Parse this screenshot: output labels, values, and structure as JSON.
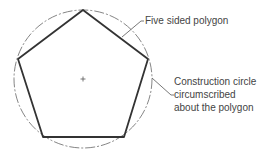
{
  "diagram": {
    "circle": {
      "cx": 83,
      "cy": 79,
      "r": 69,
      "stroke": "#666666",
      "style": "dash-dot"
    },
    "center_mark": {
      "x": 83,
      "y": 79
    },
    "polygon": {
      "sides": 5,
      "vertices": [
        [
          83,
          10
        ],
        [
          148,
          59
        ],
        [
          124,
          137
        ],
        [
          43,
          137
        ],
        [
          18,
          59
        ]
      ],
      "stroke": "#333333"
    },
    "labels": {
      "polygon_label": "Five sided polygon",
      "circle_label_line1": "Construction circle",
      "circle_label_line2": "circumscribed",
      "circle_label_line3": "about the polygon"
    },
    "leaders": {
      "polygon": [
        [
          122,
          37
        ],
        [
          141,
          21
        ],
        [
          144,
          21
        ]
      ],
      "circle": [
        [
          152,
          78
        ],
        [
          171,
          95
        ],
        [
          174,
          95
        ]
      ]
    }
  }
}
